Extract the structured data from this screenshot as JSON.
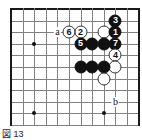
{
  "figure": {
    "caption": "図 13",
    "type": "go-board-diagram"
  },
  "board": {
    "columns": 11,
    "rows": 10,
    "cell_size": 11.6,
    "origin_x": 11,
    "origin_y": 9,
    "line_color": "#808080",
    "edge_color": "#1a1a1a",
    "background": "#ffffff",
    "star_points": [
      {
        "col": 2,
        "row": 3
      },
      {
        "col": 2,
        "row": 9
      },
      {
        "col": 8,
        "row": 9
      }
    ]
  },
  "stones": [
    {
      "id": "s1",
      "color": "black",
      "label": "3",
      "col": 9,
      "row": 1
    },
    {
      "id": "s2",
      "color": "white",
      "label": "",
      "col": 8,
      "row": 2
    },
    {
      "id": "s3",
      "color": "black",
      "label": "1",
      "col": 9,
      "row": 2
    },
    {
      "id": "s4",
      "color": "white",
      "label": "6",
      "col": 5,
      "row": 2
    },
    {
      "id": "s5",
      "color": "white",
      "label": "2",
      "col": 6,
      "row": 2
    },
    {
      "id": "s6",
      "color": "black",
      "label": "5",
      "col": 6,
      "row": 3
    },
    {
      "id": "s7",
      "color": "black",
      "label": "",
      "col": 7,
      "row": 3
    },
    {
      "id": "s8",
      "color": "black",
      "label": "",
      "col": 8,
      "row": 3
    },
    {
      "id": "s9",
      "color": "black",
      "label": "7",
      "col": 9,
      "row": 3
    },
    {
      "id": "s10",
      "color": "white",
      "label": "4",
      "col": 9,
      "row": 4
    },
    {
      "id": "s11",
      "color": "white",
      "label": "",
      "col": 9,
      "row": 5
    },
    {
      "id": "s12",
      "color": "black",
      "label": "",
      "col": 6,
      "row": 5
    },
    {
      "id": "s13",
      "color": "black",
      "label": "",
      "col": 7,
      "row": 5
    },
    {
      "id": "s14",
      "color": "black",
      "label": "",
      "col": 8,
      "row": 5
    },
    {
      "id": "s15",
      "color": "white",
      "label": "",
      "col": 8,
      "row": 6
    }
  ],
  "markers": [
    {
      "id": "m_a",
      "label": "a",
      "col": 4,
      "row": 2
    },
    {
      "id": "m_b",
      "label": "b",
      "col": 9,
      "row": 8
    }
  ]
}
